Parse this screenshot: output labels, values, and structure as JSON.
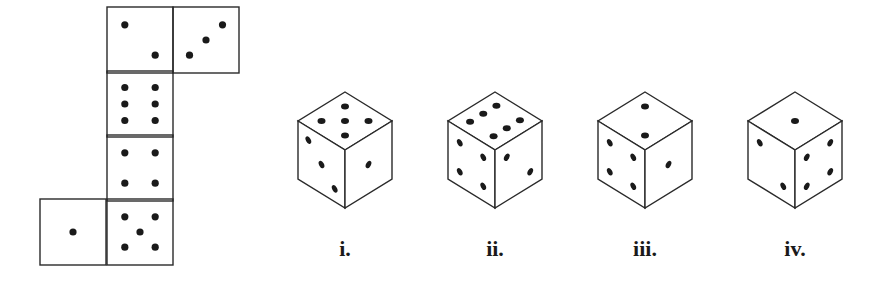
{
  "diagram": {
    "type": "dice-net-puzzle",
    "colors": {
      "line": "#2a2a2a",
      "pip": "#1a1a1a",
      "background": "#ffffff"
    },
    "net": {
      "faces": [
        {
          "id": "top-left",
          "pips": 2,
          "x": 107,
          "y": 7,
          "pattern": "diag-2"
        },
        {
          "id": "top-right",
          "pips": 3,
          "x": 173,
          "y": 7,
          "pattern": "anti-diag-3"
        },
        {
          "id": "col-2",
          "pips": 6,
          "x": 107,
          "y": 71,
          "pattern": "six"
        },
        {
          "id": "col-3",
          "pips": 4,
          "x": 107,
          "y": 135,
          "pattern": "four"
        },
        {
          "id": "col-4",
          "pips": 5,
          "x": 107,
          "y": 199,
          "pattern": "five"
        },
        {
          "id": "left",
          "pips": 1,
          "x": 40,
          "y": 199,
          "pattern": "one"
        }
      ],
      "face_size": 66
    },
    "cubes": [
      {
        "label": "i.",
        "cx": 345,
        "top": 5,
        "left": 3,
        "right": 1
      },
      {
        "label": "ii.",
        "cx": 495,
        "top": 6,
        "left": 4,
        "right": 2
      },
      {
        "label": "iii.",
        "cx": 645,
        "top": 2,
        "left": 4,
        "right": 1
      },
      {
        "label": "iv.",
        "cx": 795,
        "top": 1,
        "left": 2,
        "right": 4
      }
    ]
  },
  "labels": {
    "cube_1": "i.",
    "cube_2": "ii.",
    "cube_3": "iii.",
    "cube_4": "iv."
  }
}
